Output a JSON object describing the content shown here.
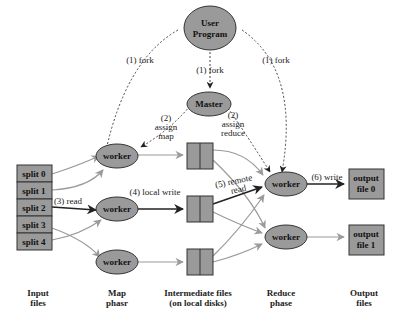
{
  "colors": {
    "node_fill": "#9a9a9a",
    "node_stroke": "#333333",
    "arrow_gray": "#9a9a9a",
    "arrow_dark": "#222222",
    "background": "#ffffff"
  },
  "nodes": {
    "user_program": {
      "line1": "User",
      "line2": "Program"
    },
    "master": {
      "label": "Master"
    },
    "map_workers": [
      {
        "label": "worker"
      },
      {
        "label": "worker"
      },
      {
        "label": "worker"
      }
    ],
    "reduce_workers": [
      {
        "label": "worker"
      },
      {
        "label": "worker"
      }
    ],
    "splits": [
      "split 0",
      "split 1",
      "split 2",
      "split 3",
      "split 4"
    ],
    "outputs": [
      {
        "line1": "output",
        "line2": "file 0"
      },
      {
        "line1": "output",
        "line2": "file 1"
      }
    ]
  },
  "edge_labels": {
    "fork_left": "(1) fork",
    "fork_center": "(1) fork",
    "fork_right": "(1) fork",
    "assign_map": {
      "line1": "(2)",
      "line2": "assign",
      "line3": "map"
    },
    "assign_reduce": {
      "line1": "(2)",
      "line2": "assign",
      "line3": "reduce"
    },
    "read": "(3) read",
    "local_write": "(4) local write",
    "remote_read": {
      "line1": "(5) remote",
      "line2": "read"
    },
    "write": "(6) write"
  },
  "columns": [
    {
      "line1": "Input",
      "line2": "files"
    },
    {
      "line1": "Map",
      "line2": "phasr"
    },
    {
      "line1": "Intermediate files",
      "line2": "(on local disks)"
    },
    {
      "line1": "Reduce",
      "line2": "phase"
    },
    {
      "line1": "Output",
      "line2": "files"
    }
  ]
}
